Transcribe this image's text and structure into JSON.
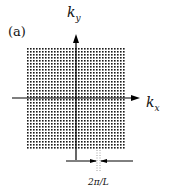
{
  "figure": {
    "panel_label": "(a)",
    "y_axis_label": "k",
    "y_axis_sub": "y",
    "x_axis_label": "k",
    "x_axis_sub": "x",
    "spacing_label": "2π/L",
    "grid": {
      "x0": 27,
      "y0": 48,
      "cols": 33,
      "rows": 34,
      "step": 3,
      "dot": 1.6,
      "color": "#1a1a1a"
    },
    "axis_color": "#000000"
  }
}
